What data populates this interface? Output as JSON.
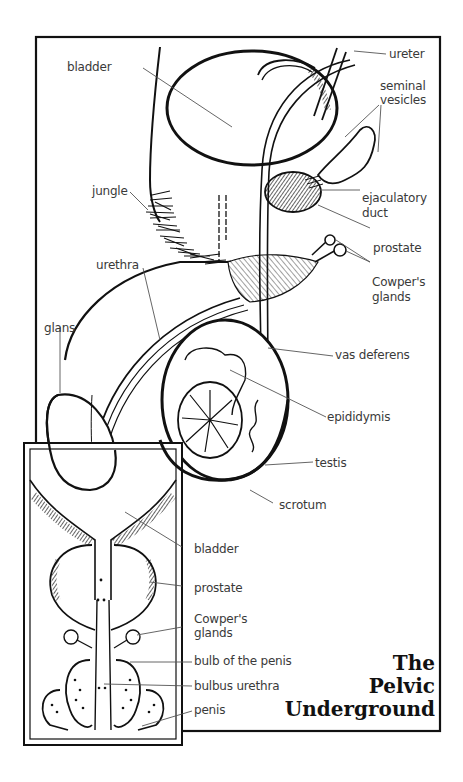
{
  "title": {
    "lines": [
      "The",
      "Pelvic",
      "Underground"
    ]
  },
  "main_labels": {
    "ureter": "ureter",
    "bladder": "bladder",
    "seminal_vesicles_1": "seminal",
    "seminal_vesicles_2": "vesicles",
    "jungle": "jungle",
    "ejaculatory_duct_1": "ejaculatory",
    "ejaculatory_duct_2": "duct",
    "prostate": "prostate",
    "cowpers_1": "Cowper's",
    "cowpers_2": "glands",
    "urethra": "urethra",
    "glans": "glans",
    "vas_deferens": "vas deferens",
    "epididymis": "epididymis",
    "testis": "testis",
    "scrotum": "scrotum"
  },
  "inset_labels": {
    "bladder": "bladder",
    "prostate": "prostate",
    "cowpers_1": "Cowper's",
    "cowpers_2": "glands",
    "bulb": "bulb of the penis",
    "bulbus_urethra": "bulbus urethra",
    "penis": "penis"
  },
  "colors": {
    "ink": "#111111",
    "label_text": "#3a3a3a",
    "leader": "#555555",
    "background": "#ffffff"
  }
}
